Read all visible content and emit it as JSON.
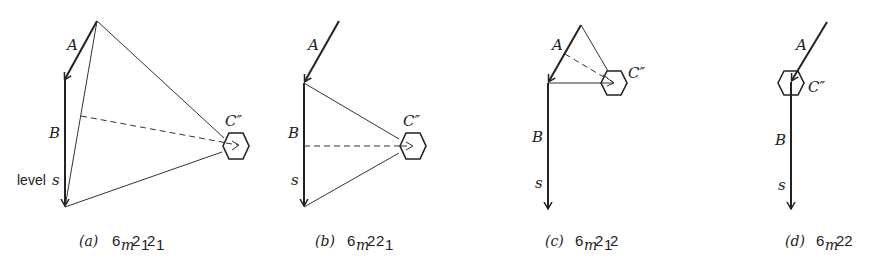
{
  "figure": {
    "panels": [
      {
        "id": "a",
        "labels": {
          "A": "A",
          "B": "B",
          "C": "C″",
          "level": "level",
          "s": "s"
        },
        "caption": {
          "tag": "(a)",
          "base": "6",
          "sub_m": "m",
          "n1": "2",
          "s1": "1",
          "n2": "2",
          "s2": "1"
        }
      },
      {
        "id": "b",
        "labels": {
          "A": "A",
          "B": "B",
          "C": "C″",
          "s": "s"
        },
        "caption": {
          "tag": "(b)",
          "base": "6",
          "sub_m": "m",
          "n1": "2",
          "n2": "2",
          "s2": "1"
        }
      },
      {
        "id": "c",
        "labels": {
          "A": "A",
          "B": "B",
          "C": "C″",
          "s": "s"
        },
        "caption": {
          "tag": "(c)",
          "base": "6",
          "sub_m": "m",
          "n1": "2",
          "s1": "1",
          "n2": "2"
        }
      },
      {
        "id": "d",
        "labels": {
          "A": "A",
          "B": "B",
          "C": "C″",
          "s": "s"
        },
        "caption": {
          "tag": "(d)",
          "base": "6",
          "sub_m": "m",
          "n1": "22"
        }
      }
    ]
  }
}
